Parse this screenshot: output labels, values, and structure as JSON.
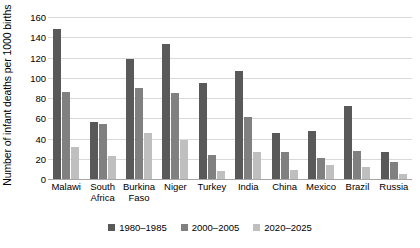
{
  "chart_data": {
    "type": "bar",
    "title": "",
    "subtitle": "",
    "xlabel": "",
    "ylabel": "Number of infant deaths per 1000 births",
    "ylim": [
      0,
      160
    ],
    "yticks": [
      0,
      20,
      40,
      60,
      80,
      100,
      120,
      140,
      160
    ],
    "ytick_labels": [
      "0",
      "20",
      "40",
      "60",
      "80",
      "100",
      "120",
      "140",
      "160"
    ],
    "grid": true,
    "legend_position": "bottom",
    "categories": [
      "Malawi",
      "South\nAfrica",
      "Burkina\nFaso",
      "Niger",
      "Turkey",
      "India",
      "China",
      "Mexico",
      "Brazil",
      "Russia"
    ],
    "series": [
      {
        "name": "1980–1985",
        "color": "#595959",
        "values": [
          148,
          56,
          119,
          133,
          95,
          107,
          45,
          47,
          72,
          27
        ]
      },
      {
        "name": "2000–2005",
        "color": "#808080",
        "values": [
          86,
          54,
          90,
          85,
          24,
          61,
          27,
          21,
          28,
          17
        ]
      },
      {
        "name": "2020–2025",
        "color": "#bfbfbf",
        "values": [
          32,
          23,
          45,
          39,
          8,
          27,
          9,
          14,
          12,
          5
        ]
      }
    ]
  },
  "colors": {
    "series_1980": "#595959",
    "series_2000": "#808080",
    "series_2020": "#bfbfbf",
    "gridline": "#d9d9d9",
    "axis": "#a6a6a6",
    "background": "#ffffff",
    "text": "#000000"
  }
}
